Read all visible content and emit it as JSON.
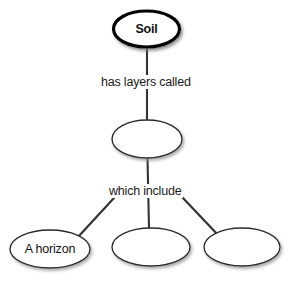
{
  "diagram": {
    "type": "concept-map",
    "colors": {
      "background": "#ffffff",
      "node_stroke": "#222222",
      "root_stroke": "#000000",
      "node_fill": "#ffffff",
      "link_stroke": "#333333",
      "text": "#111111",
      "shadow": "#b0b0b0"
    },
    "nodes": [
      {
        "id": "root",
        "label": "Soil",
        "filled_in": true,
        "emphasis": "bold-thick-outline",
        "cx": 146.5,
        "cy": 29,
        "rx": 34,
        "ry": 19,
        "stroke_width": 3.2
      },
      {
        "id": "layers",
        "label": "",
        "filled_in": false,
        "emphasis": "normal",
        "cx": 147,
        "cy": 139,
        "rx": 35,
        "ry": 19,
        "stroke_width": 1.3
      },
      {
        "id": "horizon-a",
        "label": "A horizon",
        "filled_in": true,
        "emphasis": "normal",
        "cx": 50,
        "cy": 249,
        "rx": 40,
        "ry": 19,
        "stroke_width": 1.3
      },
      {
        "id": "horizon-blank-1",
        "label": "",
        "filled_in": false,
        "emphasis": "normal",
        "cx": 151,
        "cy": 247,
        "rx": 39,
        "ry": 19,
        "stroke_width": 1.3
      },
      {
        "id": "horizon-blank-2",
        "label": "",
        "filled_in": false,
        "emphasis": "normal",
        "cx": 242,
        "cy": 247,
        "rx": 38,
        "ry": 19,
        "stroke_width": 1.3
      }
    ],
    "links": [
      {
        "id": "root-to-layers",
        "label": "has layers called",
        "from": "root",
        "to": "layers",
        "x1": 147,
        "y1": 48,
        "x2": 147,
        "y2": 120,
        "label_x": 99,
        "label_y": 76
      },
      {
        "id": "layers-to-middle",
        "label": "which include",
        "from": "layers",
        "to": "horizon-blank-1",
        "x1": 147,
        "y1": 158,
        "x2": 149,
        "y2": 228,
        "label_x": 107,
        "label_y": 185
      },
      {
        "id": "layers-to-left",
        "label": "",
        "from": "layers",
        "to": "horizon-a",
        "x1": 114,
        "y1": 198,
        "x2": 78,
        "y2": 237
      },
      {
        "id": "layers-to-right",
        "label": "",
        "from": "layers",
        "to": "horizon-blank-2",
        "x1": 182,
        "y1": 197,
        "x2": 219,
        "y2": 236
      }
    ]
  }
}
